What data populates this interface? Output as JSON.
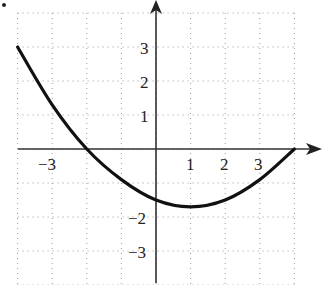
{
  "chart_data": {
    "type": "line",
    "title": "",
    "xlabel": "",
    "ylabel": "",
    "xlim": [
      -4,
      4
    ],
    "ylim": [
      -4,
      4
    ],
    "grid": true,
    "grid_style": "dotted",
    "x_tick_labels": [
      "−3",
      "1",
      "2",
      "3"
    ],
    "x_tick_values": [
      -3,
      1,
      2,
      3
    ],
    "y_tick_labels": [
      "3",
      "2",
      "1",
      "−2",
      "−3"
    ],
    "y_tick_values": [
      3,
      2,
      1,
      -2,
      -3
    ],
    "series": [
      {
        "name": "f(x)",
        "description": "Upward-opening parabola, x-intercepts at -2 and 4, vertex near (1, -1.7)",
        "x": [
          -4,
          -3,
          -2,
          -1,
          0,
          1,
          2,
          3,
          4
        ],
        "y": [
          3.0,
          1.3,
          0.0,
          -0.9,
          -1.5,
          -1.7,
          -1.5,
          -0.9,
          0.0
        ]
      }
    ],
    "annotations": [
      "•"
    ]
  },
  "colors": {
    "curve": "#111111",
    "axis": "#333333",
    "grid": "#999999"
  }
}
